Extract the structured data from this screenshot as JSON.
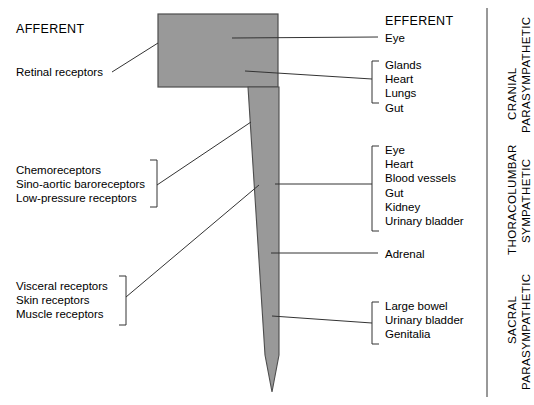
{
  "diagram": {
    "title_afferent": "AFFERENT",
    "title_efferent": "EFFERENT",
    "cns_shape_color": "#999999",
    "cns_outline_color": "#4d4d4d",
    "line_color": "#333333"
  },
  "afferent": {
    "heading": "AFFERENT",
    "single": {
      "label": "Retinal receptors"
    },
    "groups": [
      {
        "items": [
          "Chemoreceptors",
          "Sino-aortic baroreceptors",
          "Low-pressure receptors"
        ]
      },
      {
        "items": [
          "Visceral receptors",
          "Skin receptors",
          "Muscle receptors"
        ]
      }
    ]
  },
  "efferent": {
    "heading": "EFFERENT",
    "single_top": {
      "label": "Eye"
    },
    "single_adrenal": {
      "label": "Adrenal"
    },
    "groups": [
      {
        "items": [
          "Glands",
          "Heart",
          "Lungs",
          "Gut"
        ]
      },
      {
        "items": [
          "Eye",
          "Heart",
          "Blood vessels",
          "Gut",
          "Kidney",
          "Urinary bladder"
        ]
      },
      {
        "items": [
          "Large bowel",
          "Urinary bladder",
          "Genitalia"
        ]
      }
    ]
  },
  "divisions": [
    {
      "line1": "CRANIAL",
      "line2": "PARASYMPATHETIC"
    },
    {
      "line1": "THORACOLUMBAR",
      "line2": "SYMPATHETIC"
    },
    {
      "line1": "SACRAL",
      "line2": "PARASYMPATHETIC"
    }
  ]
}
